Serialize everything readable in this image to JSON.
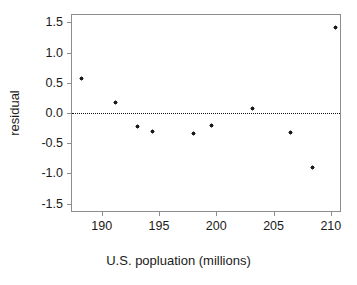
{
  "chart_data": {
    "type": "scatter",
    "title": "",
    "xlabel": "U.S. popluation (millions)",
    "ylabel": "residual",
    "xlim": [
      187.4,
      210.8
    ],
    "ylim": [
      -1.62,
      1.62
    ],
    "xticks": [
      190,
      195,
      200,
      205,
      210
    ],
    "xticklabels": [
      "190",
      "195",
      "200",
      "205",
      "210"
    ],
    "yticks": [
      1.5,
      1.0,
      0.5,
      0.0,
      -0.5,
      -1.0,
      -1.5
    ],
    "yticklabels": [
      "1.5",
      "1.0",
      "0.5",
      "0.0",
      "-0.5",
      "-1.0",
      "-1.5"
    ],
    "grid": false,
    "legend": null,
    "marker": "asterisk",
    "marker_color": "#1c1c1c",
    "frame_color": "#8d8d8d",
    "reference_lines": [
      {
        "name": "zero-residual-line",
        "axis": "horizontal",
        "value": 0.0,
        "style": "dotted",
        "color": "#111111"
      }
    ],
    "x": [
      188.2,
      191.2,
      193.1,
      194.4,
      198.0,
      199.6,
      203.2,
      206.5,
      208.4,
      210.4
    ],
    "y": [
      0.57,
      0.17,
      -0.23,
      -0.3,
      -0.34,
      -0.21,
      0.07,
      -0.33,
      -0.9,
      1.41
    ],
    "points": [
      {
        "x": 188.2,
        "y": 0.57
      },
      {
        "x": 191.2,
        "y": 0.17
      },
      {
        "x": 193.1,
        "y": -0.23
      },
      {
        "x": 194.4,
        "y": -0.3
      },
      {
        "x": 198.0,
        "y": -0.34
      },
      {
        "x": 199.6,
        "y": -0.21
      },
      {
        "x": 203.2,
        "y": 0.07
      },
      {
        "x": 206.5,
        "y": -0.33
      },
      {
        "x": 208.4,
        "y": -0.9
      },
      {
        "x": 210.4,
        "y": 1.41
      }
    ]
  }
}
